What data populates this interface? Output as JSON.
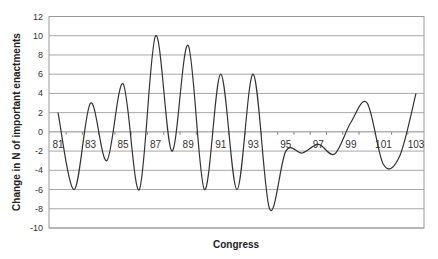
{
  "chart_data": {
    "type": "line",
    "title": "",
    "xlabel": "Congress",
    "ylabel": "Change in N of important enactments",
    "ylim": [
      -10,
      12
    ],
    "yticks": [
      12,
      10,
      8,
      6,
      4,
      2,
      0,
      -2,
      -4,
      -6,
      -8,
      -10
    ],
    "xtick_labels": [
      "81",
      "83",
      "85",
      "87",
      "89",
      "91",
      "93",
      "95",
      "97",
      "99",
      "101",
      "103"
    ],
    "grid": true,
    "legend": null,
    "smooth": true,
    "x": [
      81,
      82,
      83,
      84,
      85,
      86,
      87,
      88,
      89,
      90,
      91,
      92,
      93,
      94,
      95,
      96,
      97,
      98,
      99,
      100,
      101,
      102,
      103
    ],
    "values": [
      2,
      -6,
      3,
      -3,
      5,
      -6,
      10,
      -2,
      9,
      -6,
      6,
      -6,
      6,
      -8,
      -2,
      -2.2,
      -1.3,
      -2.3,
      1,
      3,
      -3.4,
      -2.5,
      4
    ],
    "line_color": "#333333"
  }
}
